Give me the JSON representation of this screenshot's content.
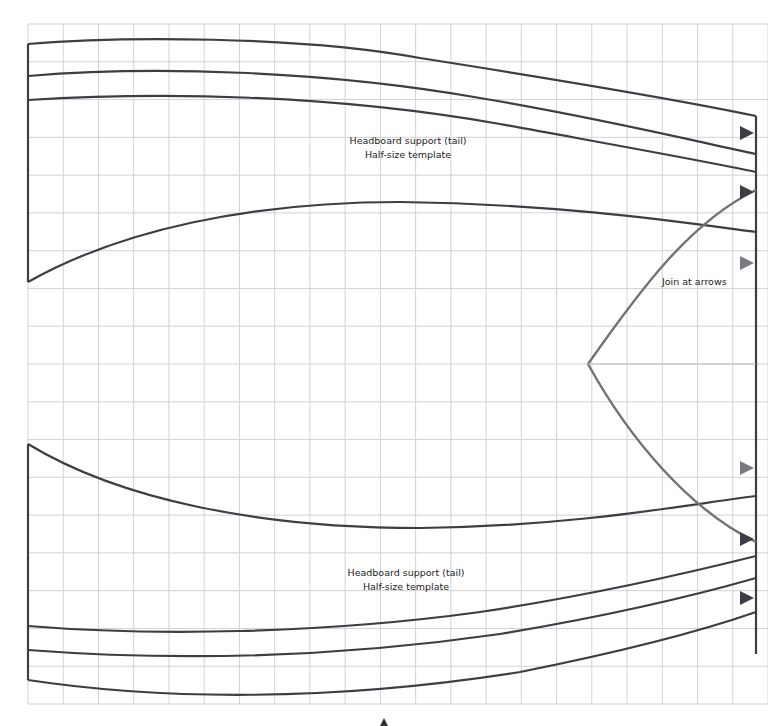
{
  "diagram": {
    "grid": {
      "color": "#cfcfcf",
      "x0": 28,
      "x1": 768,
      "y0": 24,
      "y1": 704,
      "cols": 21,
      "rows": 18
    },
    "colors": {
      "outline": "#3d3d45",
      "join_curve": "#707078",
      "arrow_dark": "#3d3d45",
      "arrow_light": "#7a7a80"
    },
    "top_template": {
      "title": "Headboard support (tail)",
      "subtitle": "Half-size template"
    },
    "bottom_template": {
      "title": "Headboard support (tail)",
      "subtitle": "Half-size template"
    },
    "join_note": "Join at arrows"
  }
}
